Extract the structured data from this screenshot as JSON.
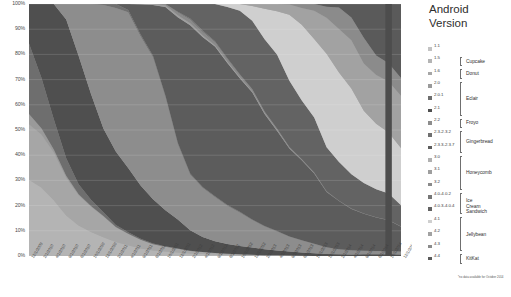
{
  "legend": {
    "title": "Android\nVersion",
    "footnote": "*no data available for October 2014",
    "items": [
      {
        "version": "1.1",
        "color": "#c3c3c3"
      },
      {
        "version": "1.5",
        "color": "#b4b4b4"
      },
      {
        "version": "1.6",
        "color": "#a6a6a6"
      },
      {
        "version": "2.0",
        "color": "#9a9a9a"
      },
      {
        "version": "2.0.1",
        "color": "#6e6e6e"
      },
      {
        "version": "2.1",
        "color": "#4f4f4f"
      },
      {
        "version": "2.2",
        "color": "#8d8d8d"
      },
      {
        "version": "2.3-2.3.2",
        "color": "#707070"
      },
      {
        "version": "2.3.3-2.3.7",
        "color": "#5c5c5c"
      },
      {
        "version": "3.0",
        "color": "#b0b0b0"
      },
      {
        "version": "3.1",
        "color": "#9e9e9e"
      },
      {
        "version": "3.2",
        "color": "#8a8a8a"
      },
      {
        "version": "4.0-4.0.2",
        "color": "#767676"
      },
      {
        "version": "4.0.3-4.0.4",
        "color": "#636363"
      },
      {
        "version": "4.1",
        "color": "#cfcfcf"
      },
      {
        "version": "4.2",
        "color": "#a2a2a2"
      },
      {
        "version": "4.3",
        "color": "#8b8b8b"
      },
      {
        "version": "4.4",
        "color": "#5a5a5a"
      }
    ],
    "groups": [
      {
        "name": "Cupcake",
        "start": 1,
        "end": 1
      },
      {
        "name": "Donut",
        "start": 2,
        "end": 2
      },
      {
        "name": "Eclair",
        "start": 3,
        "end": 5
      },
      {
        "name": "Froyo",
        "start": 6,
        "end": 6
      },
      {
        "name": "Gingerbread",
        "start": 7,
        "end": 8
      },
      {
        "name": "Honeycomb",
        "start": 9,
        "end": 11
      },
      {
        "name": "Ice Cream\nSandwich",
        "start": 12,
        "end": 13
      },
      {
        "name": "Jellybean",
        "start": 14,
        "end": 16
      },
      {
        "name": "KitKat",
        "start": 17,
        "end": 17
      }
    ]
  },
  "chart_data": {
    "type": "area",
    "xlabel": "",
    "ylabel": "",
    "ylim": [
      0,
      100
    ],
    "stacked": true,
    "normalized": true,
    "grid": true,
    "legend_position": "right",
    "ytick_labels": [
      "0%",
      "10%",
      "20%",
      "30%",
      "40%",
      "50%",
      "60%",
      "70%",
      "80%",
      "90%",
      "100%"
    ],
    "ytick_values": [
      0,
      10,
      20,
      30,
      40,
      50,
      60,
      70,
      80,
      90,
      100
    ],
    "x": [
      "12/1/2009",
      "2/1/2010",
      "4/1/2010",
      "6/1/2010",
      "8/1/2010",
      "10/1/2010",
      "12/1/2010",
      "2/1/2011",
      "4/1/2011",
      "6/1/2011",
      "8/1/2011",
      "10/1/2011",
      "12/1/2011",
      "2/1/2012",
      "4/1/2012",
      "6/1/2012",
      "8/1/2012",
      "10/1/2012",
      "12/1/2012",
      "2/1/2013",
      "4/1/2013",
      "6/1/2013",
      "8/1/2013",
      "10/1/2013",
      "12/1/2013",
      "2/1/2014",
      "4/1/2014",
      "6/1/2014",
      "8/1/2014",
      "10/1/2014",
      "12/1/2014"
    ],
    "annotations": [
      "*no data available for October 2014"
    ],
    "series": [
      {
        "name": "1.1",
        "color": "#c3c3c3",
        "values": [
          0.3,
          0.2,
          0.1,
          0.1,
          0.1,
          0,
          0,
          0,
          0,
          0,
          0,
          0,
          0,
          0,
          0,
          0,
          0,
          0,
          0,
          0,
          0,
          0,
          0,
          0,
          0,
          0,
          0,
          0,
          0,
          0,
          0
        ]
      },
      {
        "name": "1.5",
        "color": "#b4b4b4",
        "values": [
          30,
          27,
          22,
          16,
          12,
          9.5,
          7.9,
          6,
          4.5,
          3,
          2.2,
          1.8,
          1.4,
          1,
          0.8,
          0.6,
          0.4,
          0.3,
          0.2,
          0.1,
          0.1,
          0.1,
          0,
          0,
          0,
          0,
          0,
          0,
          0,
          0,
          0
        ]
      },
      {
        "name": "1.6",
        "color": "#a6a6a6",
        "values": [
          22,
          21,
          19,
          15,
          12,
          10,
          8.7,
          6.3,
          4.8,
          3.5,
          2.4,
          1.9,
          1.5,
          1.1,
          0.9,
          0.7,
          0.5,
          0.4,
          0.3,
          0.2,
          0.2,
          0.1,
          0.1,
          0,
          0,
          0,
          0,
          0,
          0,
          0,
          0
        ]
      },
      {
        "name": "2.0",
        "color": "#9a9a9a",
        "values": [
          4,
          2.5,
          1.2,
          0.7,
          0.4,
          0.3,
          0.2,
          0.1,
          0.1,
          0,
          0,
          0,
          0,
          0,
          0,
          0,
          0,
          0,
          0,
          0,
          0,
          0,
          0,
          0,
          0,
          0,
          0,
          0,
          0,
          0,
          0
        ]
      },
      {
        "name": "2.0.1",
        "color": "#6e6e6e",
        "values": [
          28,
          20,
          12,
          7,
          4,
          2.5,
          1.5,
          0.9,
          0.6,
          0.4,
          0.3,
          0.2,
          0.1,
          0.1,
          0,
          0,
          0,
          0,
          0,
          0,
          0,
          0,
          0,
          0,
          0,
          0,
          0,
          0,
          0,
          0,
          0
        ]
      },
      {
        "name": "2.1",
        "color": "#4f4f4f",
        "values": [
          15.7,
          29.3,
          45.7,
          55,
          51,
          42,
          35.2,
          31.4,
          27.2,
          21.2,
          17.5,
          14.4,
          11.7,
          8.5,
          6.4,
          5,
          4,
          3.4,
          2.9,
          2.4,
          1.9,
          1.5,
          1.2,
          1,
          0.8,
          0.7,
          0.6,
          0.7,
          0.7,
          0.7,
          0.6
        ]
      },
      {
        "name": "2.2",
        "color": "#8d8d8d",
        "values": [
          0,
          0,
          0,
          6.2,
          20.5,
          35.7,
          51.8,
          61.3,
          65.9,
          59.4,
          55.9,
          45.3,
          30.4,
          23.1,
          20.9,
          19.1,
          15.5,
          13.6,
          11,
          9.0,
          7.5,
          5.8,
          4.6,
          3.5,
          2.5,
          1.9,
          1.5,
          1.3,
          1.2,
          1.2,
          1.1
        ]
      },
      {
        "name": "2.3-2.3.2",
        "color": "#707070",
        "values": [
          0,
          0,
          0,
          0,
          0,
          0,
          0.4,
          1.7,
          1.0,
          0.7,
          0.6,
          0.5,
          0.5,
          0.4,
          0.3,
          0.3,
          0.3,
          0.3,
          0.2,
          0.2,
          0.2,
          0.1,
          0.1,
          0.1,
          0.1,
          0.1,
          0.1,
          0.1,
          0.1,
          0.1,
          0.1
        ]
      },
      {
        "name": "2.3.3-2.3.7",
        "color": "#5c5c5c",
        "values": [
          0,
          0,
          0,
          0,
          0,
          0,
          0,
          0,
          2.5,
          12.0,
          20.0,
          35.3,
          50.6,
          61.5,
          63.7,
          64.4,
          57.5,
          54.2,
          50.8,
          44.2,
          39.7,
          34.1,
          30.7,
          26.3,
          21.2,
          19.0,
          16.2,
          14.9,
          13.6,
          12.3,
          9.8
        ]
      },
      {
        "name": "3.0",
        "color": "#b0b0b0",
        "values": [
          0,
          0,
          0,
          0,
          0,
          0,
          0,
          0,
          0,
          0.1,
          0.1,
          0.1,
          0.1,
          0.1,
          0.1,
          0.1,
          0.1,
          0,
          0,
          0,
          0,
          0,
          0,
          0,
          0,
          0,
          0,
          0,
          0,
          0,
          0
        ]
      },
      {
        "name": "3.1",
        "color": "#9e9e9e",
        "values": [
          0,
          0,
          0,
          0,
          0,
          0,
          0,
          0,
          0,
          0,
          0.3,
          0.6,
          0.7,
          0.7,
          0.6,
          0.5,
          0.4,
          0.4,
          0.3,
          0.3,
          0.2,
          0.1,
          0.1,
          0.1,
          0,
          0,
          0,
          0,
          0,
          0,
          0
        ]
      },
      {
        "name": "3.2",
        "color": "#8a8a8a",
        "values": [
          0,
          0,
          0,
          0,
          0,
          0,
          0,
          0,
          0,
          0,
          0,
          0.5,
          1.1,
          1.5,
          1.4,
          1.2,
          1.0,
          0.9,
          0.8,
          0.6,
          0.5,
          0.4,
          0.2,
          0.1,
          0.1,
          0,
          0,
          0,
          0,
          0,
          0
        ]
      },
      {
        "name": "4.0-4.0.2",
        "color": "#767676",
        "values": [
          0,
          0,
          0,
          0,
          0,
          0,
          0,
          0,
          0,
          0,
          0,
          0,
          0.3,
          0.5,
          0.6,
          0.5,
          0.4,
          0.3,
          0.2,
          0.1,
          0.1,
          0.1,
          0.1,
          0.1,
          0.1,
          0.1,
          0.1,
          0.1,
          0.1,
          0.1,
          0.1
        ]
      },
      {
        "name": "4.0.3-4.0.4",
        "color": "#636363",
        "values": [
          0,
          0,
          0,
          0,
          0,
          0,
          0,
          0,
          0,
          0,
          0,
          0,
          3.1,
          6.0,
          11.3,
          16.0,
          20.8,
          25.8,
          27.2,
          28.6,
          29.3,
          25.6,
          22.5,
          20.6,
          16.9,
          15.2,
          13.4,
          12.3,
          11.4,
          10.6,
          8.5
        ]
      },
      {
        "name": "4.1",
        "color": "#cfcfcf",
        "values": [
          0,
          0,
          0,
          0,
          0,
          0,
          0,
          0,
          0,
          0,
          0,
          0,
          0,
          0,
          0,
          0,
          1.2,
          2.7,
          5.9,
          12.0,
          17.1,
          25.6,
          29.0,
          29.4,
          35.9,
          35.3,
          33.5,
          29.0,
          26.5,
          24.5,
          22.8
        ]
      },
      {
        "name": "4.2",
        "color": "#a2a2a2",
        "values": [
          0,
          0,
          0,
          0,
          0,
          0,
          0,
          0,
          0,
          0,
          0,
          0,
          0,
          0,
          0,
          0,
          0,
          0,
          0.8,
          1.9,
          2.9,
          4.0,
          6.5,
          10.6,
          13.8,
          17.1,
          18.8,
          19.1,
          19.8,
          20.4,
          20.8
        ]
      },
      {
        "name": "4.3",
        "color": "#8b8b8b",
        "values": [
          0,
          0,
          0,
          0,
          0,
          0,
          0,
          0,
          0,
          0,
          0,
          0,
          0,
          0,
          0,
          0,
          0,
          0,
          0,
          0,
          0,
          0.2,
          1.5,
          2.5,
          4.2,
          8.5,
          8.9,
          10.3,
          7.9,
          7.4,
          7.0
        ]
      },
      {
        "name": "4.4",
        "color": "#5a5a5a",
        "values": [
          0,
          0,
          0,
          0,
          0,
          0,
          0,
          0,
          0,
          0,
          0,
          0,
          0,
          0,
          0,
          0,
          0,
          0,
          0,
          0,
          0,
          0,
          0,
          0,
          1.1,
          1.4,
          5.3,
          13.6,
          20.9,
          23.7,
          29.5
        ]
      }
    ]
  }
}
